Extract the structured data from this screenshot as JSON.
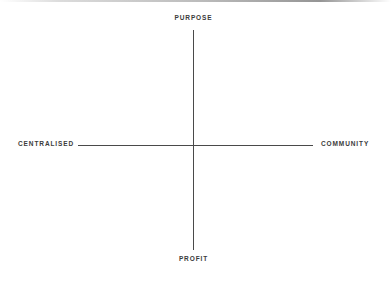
{
  "chart_data": {
    "type": "scatter",
    "title": "",
    "subtitle": "",
    "xlabel": "",
    "ylabel": "",
    "grid": false,
    "legend": null,
    "axes": {
      "vertical": {
        "top_label": "PURPOSE",
        "bottom_label": "PROFIT"
      },
      "horizontal": {
        "left_label": "CENTRALISED",
        "right_label": "COMMUNITY"
      }
    },
    "annotations": [],
    "points": [],
    "line_color": "#4a4a4a",
    "background_color": "#ffffff",
    "text_color": "#3b3b3b"
  },
  "diagram": {
    "labels": {
      "top": "PURPOSE",
      "bottom": "PROFIT",
      "left": "CENTRALISED",
      "right": "COMMUNITY"
    }
  }
}
